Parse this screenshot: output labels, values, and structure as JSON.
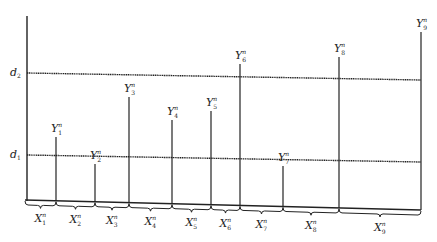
{
  "diagram": {
    "type": "threshold-segmentation",
    "axis": {
      "x": 27,
      "top": 16,
      "bottom": 201
    },
    "thresholds": [
      {
        "label": "d",
        "sub": "2",
        "x1": 27,
        "y1": 73,
        "x2": 421,
        "y2": 80,
        "label_x": 10,
        "label_y": 76
      },
      {
        "label": "d",
        "sub": "1",
        "x1": 27,
        "y1": 155,
        "x2": 421,
        "y2": 162,
        "label_x": 10,
        "label_y": 158
      }
    ],
    "baseline": {
      "x1": 25,
      "y1": 200,
      "x2": 421,
      "y2": 210
    },
    "peaks": [
      {
        "label": "Y",
        "sub": "1",
        "sup": "n",
        "x": 56,
        "top": 137
      },
      {
        "label": "Y",
        "sub": "2",
        "sup": "n",
        "x": 95,
        "top": 164
      },
      {
        "label": "Y",
        "sub": "3",
        "sup": "n",
        "x": 129,
        "top": 97
      },
      {
        "label": "Y",
        "sub": "4",
        "sup": "n",
        "x": 172,
        "top": 120
      },
      {
        "label": "Y",
        "sub": "5",
        "sup": "n",
        "x": 211,
        "top": 111
      },
      {
        "label": "Y",
        "sub": "6",
        "sup": "n",
        "x": 240,
        "top": 64
      },
      {
        "label": "Y",
        "sub": "7",
        "sup": "n",
        "x": 283,
        "top": 166
      },
      {
        "label": "Y",
        "sub": "8",
        "sup": "n",
        "x": 339,
        "top": 57
      },
      {
        "label": "Y",
        "sub": "9",
        "sup": "n",
        "x": 421,
        "top": 32
      }
    ],
    "intervals": [
      {
        "label": "X",
        "sub": "1",
        "sup": "n",
        "x1": 25,
        "x2": 56
      },
      {
        "label": "X",
        "sub": "2",
        "sup": "n",
        "x1": 56,
        "x2": 95
      },
      {
        "label": "X",
        "sub": "3",
        "sup": "n",
        "x1": 95,
        "x2": 129
      },
      {
        "label": "X",
        "sub": "4",
        "sup": "n",
        "x1": 129,
        "x2": 172
      },
      {
        "label": "X",
        "sub": "5",
        "sup": "n",
        "x1": 172,
        "x2": 211
      },
      {
        "label": "X",
        "sub": "6",
        "sup": "n",
        "x1": 211,
        "x2": 240
      },
      {
        "label": "X",
        "sub": "7",
        "sup": "n",
        "x1": 240,
        "x2": 283
      },
      {
        "label": "X",
        "sub": "8",
        "sup": "n",
        "x1": 283,
        "x2": 339
      },
      {
        "label": "X",
        "sub": "9",
        "sup": "n",
        "x1": 339,
        "x2": 421
      }
    ],
    "colors": {
      "line": "#222222",
      "background": "#ffffff"
    }
  }
}
